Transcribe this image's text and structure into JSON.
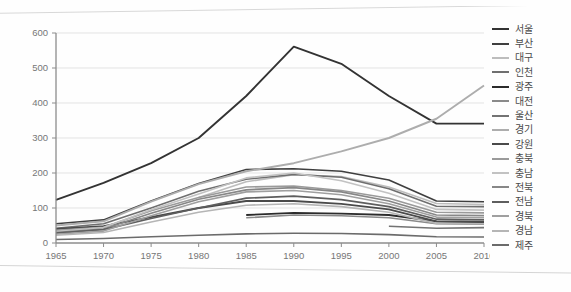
{
  "chart_data": {
    "type": "line",
    "title": "",
    "subtitle": "",
    "xlabel": "",
    "ylabel": "",
    "x": [
      1965,
      1970,
      1975,
      1980,
      1985,
      1990,
      1995,
      2000,
      2005,
      2010
    ],
    "xtick_labels": [
      "1965",
      "1970",
      "1975",
      "1980",
      "1985",
      "1990",
      "1995",
      "2000",
      "2005",
      "2010"
    ],
    "ytick_labels": [
      "0",
      "100",
      "200",
      "300",
      "400",
      "500",
      "600"
    ],
    "yticks": [
      0,
      100,
      200,
      300,
      400,
      500,
      600
    ],
    "xlim": [
      1965,
      2010
    ],
    "ylim": [
      0,
      600
    ],
    "grid": "horizontal",
    "legend_position": "right",
    "series": [
      {
        "name": "서울",
        "color": "#333333",
        "width": 1.9,
        "values": [
          123,
          172,
          228,
          300,
          420,
          561,
          512,
          420,
          341,
          341
        ]
      },
      {
        "name": "부산",
        "color": "#3f3f3f",
        "width": 1.6,
        "values": [
          55,
          66,
          120,
          170,
          210,
          212,
          205,
          180,
          120,
          118
        ]
      },
      {
        "name": "대구",
        "color": "#bdbdbd",
        "width": 1.6,
        "values": [
          null,
          null,
          null,
          130,
          175,
          195,
          190,
          160,
          113,
          110
        ]
      },
      {
        "name": "인천",
        "color": "#6f6f6f",
        "width": 1.6,
        "values": [
          42,
          55,
          100,
          148,
          182,
          196,
          188,
          155,
          105,
          104
        ]
      },
      {
        "name": "광주",
        "color": "#2b2b2b",
        "width": 1.8,
        "values": [
          null,
          null,
          null,
          null,
          80,
          86,
          84,
          80,
          62,
          60
        ]
      },
      {
        "name": "대전",
        "color": "#8a8a8a",
        "width": 1.6,
        "values": [
          null,
          null,
          null,
          null,
          72,
          80,
          78,
          72,
          55,
          54
        ]
      },
      {
        "name": "울산",
        "color": "#737373",
        "width": 1.6,
        "values": [
          null,
          null,
          null,
          null,
          null,
          null,
          null,
          48,
          42,
          44
        ]
      },
      {
        "name": "경기",
        "color": "#adadad",
        "width": 1.9,
        "values": [
          50,
          62,
          118,
          168,
          205,
          228,
          262,
          300,
          355,
          450
        ]
      },
      {
        "name": "강원",
        "color": "#4a4a4a",
        "width": 1.8,
        "values": [
          40,
          48,
          74,
          100,
          120,
          120,
          112,
          96,
          62,
          60
        ]
      },
      {
        "name": "충북",
        "color": "#9a9a9a",
        "width": 1.6,
        "values": [
          36,
          45,
          92,
          130,
          160,
          163,
          150,
          128,
          88,
          86
        ]
      },
      {
        "name": "충남",
        "color": "#c2c2c2",
        "width": 1.6,
        "values": [
          33,
          44,
          95,
          140,
          186,
          200,
          178,
          142,
          96,
          94
        ]
      },
      {
        "name": "전북",
        "color": "#878787",
        "width": 1.7,
        "values": [
          30,
          40,
          85,
          125,
          152,
          158,
          146,
          120,
          80,
          78
        ]
      },
      {
        "name": "전남",
        "color": "#5e5e5e",
        "width": 1.7,
        "values": [
          28,
          38,
          70,
          100,
          128,
          134,
          124,
          104,
          68,
          66
        ]
      },
      {
        "name": "경북",
        "color": "#9f9f9f",
        "width": 1.6,
        "values": [
          25,
          34,
          78,
          118,
          146,
          150,
          138,
          112,
          74,
          72
        ]
      },
      {
        "name": "경남",
        "color": "#b5b5b5",
        "width": 1.6,
        "values": [
          22,
          30,
          60,
          88,
          108,
          112,
          104,
          88,
          56,
          55
        ]
      },
      {
        "name": "제주",
        "color": "#6b6b6b",
        "width": 1.6,
        "values": [
          10,
          13,
          18,
          22,
          26,
          28,
          27,
          24,
          18,
          17
        ]
      }
    ]
  },
  "legend": {
    "items": [
      {
        "label": "서울"
      },
      {
        "label": "부산"
      },
      {
        "label": "대구"
      },
      {
        "label": "인천"
      },
      {
        "label": "광주"
      },
      {
        "label": "대전"
      },
      {
        "label": "울산"
      },
      {
        "label": "경기"
      },
      {
        "label": "강원"
      },
      {
        "label": "충북"
      },
      {
        "label": "충남"
      },
      {
        "label": "전북"
      },
      {
        "label": "전남"
      },
      {
        "label": "경북"
      },
      {
        "label": "경남"
      },
      {
        "label": "제주"
      }
    ]
  },
  "colors": {
    "axis": "#8c8c8c",
    "grid": "#e3e3e3",
    "tick_text": "#767676",
    "background": "#fefefe"
  }
}
